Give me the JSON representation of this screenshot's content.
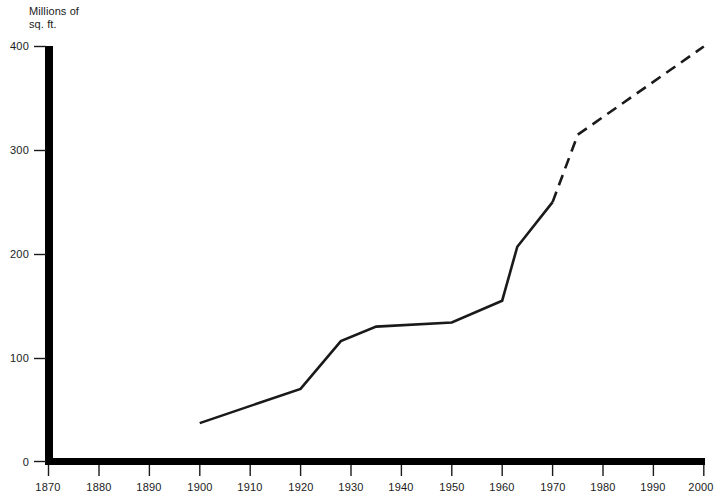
{
  "chart_data": {
    "type": "line",
    "title": "",
    "ylabel": "Millions of\nsq. ft.",
    "xlabel": "",
    "xlim": [
      1870,
      2000
    ],
    "ylim": [
      0,
      400
    ],
    "grid": false,
    "legend": "none",
    "x_ticks": [
      1870,
      1880,
      1890,
      1900,
      1910,
      1920,
      1930,
      1940,
      1950,
      1960,
      1970,
      1980,
      1990,
      2000
    ],
    "y_ticks": [
      0,
      100,
      200,
      300,
      400
    ],
    "series": [
      {
        "name": "Actual",
        "style": "solid",
        "x": [
          1900,
          1920,
          1928,
          1935,
          1950,
          1960,
          1963,
          1970
        ],
        "values": [
          37,
          70,
          116,
          130,
          134,
          155,
          207,
          250
        ]
      },
      {
        "name": "Projected",
        "style": "dashed",
        "x": [
          1970,
          1975,
          2000
        ],
        "values": [
          250,
          315,
          400
        ]
      }
    ],
    "annotations": []
  },
  "axis_labels": {
    "y_title": "Millions of\nsq. ft.",
    "y": [
      "0",
      "100",
      "200",
      "300",
      "400"
    ],
    "x": [
      "1870",
      "1880",
      "1890",
      "1900",
      "1910",
      "1920",
      "1930",
      "1940",
      "1950",
      "1960",
      "1970",
      "1980",
      "1990",
      "2000"
    ]
  },
  "colors": {
    "line": "#1a1a1a",
    "axis": "#000000",
    "background": "#ffffff",
    "text": "#1a1a1a"
  }
}
